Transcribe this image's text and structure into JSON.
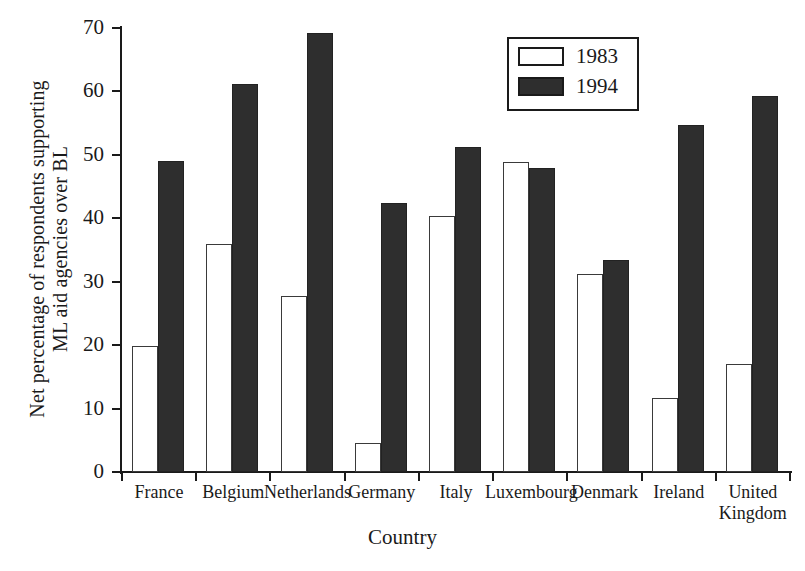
{
  "chart_data": {
    "type": "bar",
    "title": "",
    "xlabel": "Country",
    "ylabel": "Net percentage of respondents supporting\nML aid agencies over BL",
    "ylim": [
      0,
      70
    ],
    "yticks": [
      0,
      10,
      20,
      30,
      40,
      50,
      60,
      70
    ],
    "ytick_labels": [
      "0",
      "10",
      "20",
      "30",
      "40",
      "50",
      "60",
      "70"
    ],
    "grid": false,
    "legend_position": "upper-center-right",
    "categories": [
      "France",
      "Belgium",
      "Netherlands",
      "Germany",
      "Italy",
      "Luxembourg",
      "Denmark",
      "Ireland",
      "United\nKingdom"
    ],
    "series": [
      {
        "name": "1983",
        "color": "#ffffff",
        "edge_color": "#3a3a3a",
        "values": [
          19.9,
          35.9,
          27.8,
          4.5,
          40.4,
          48.8,
          31.2,
          11.7,
          17.0
        ]
      },
      {
        "name": "1994",
        "color": "#2e2e2e",
        "edge_color": "#222222",
        "values": [
          49.1,
          61.1,
          69.2,
          42.4,
          51.3,
          47.9,
          33.5,
          54.7,
          59.3
        ]
      }
    ]
  },
  "legend": {
    "items": [
      {
        "label": "1983"
      },
      {
        "label": "1994"
      }
    ]
  },
  "axes": {
    "x_title": "Country",
    "y_title": "Net percentage of respondents supporting\nML aid agencies over BL"
  }
}
